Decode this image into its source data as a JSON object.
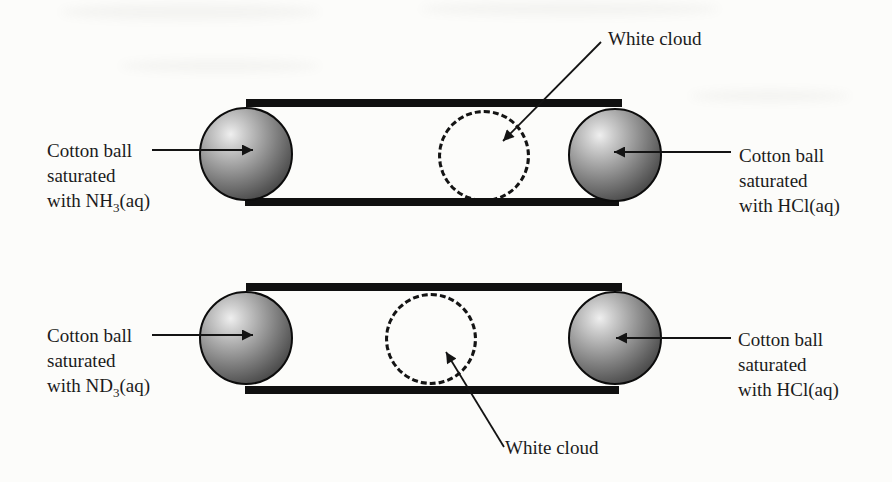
{
  "scene": {
    "background_color": "#fcfcfa",
    "ink_color": "#141414",
    "tube_color": "#101010",
    "sphere_highlight_color": "#efefef",
    "sphere_shadow_color": "#262626"
  },
  "top_tube": {
    "cloud_label": "White cloud",
    "cloud_position": "right of center, nearer HCl end",
    "left_label": {
      "line1": "Cotton ball",
      "line2": "saturated",
      "line3_pre": "with NH",
      "line3_sub": "3",
      "line3_post": "(aq)"
    },
    "right_label": {
      "line1": "Cotton ball",
      "line2": "saturated",
      "line3_pre": "with HCl(aq)",
      "line3_sub": "",
      "line3_post": ""
    }
  },
  "bottom_tube": {
    "cloud_label": "White cloud",
    "cloud_position": "at center of tube",
    "left_label": {
      "line1": "Cotton ball",
      "line2": "saturated",
      "line3_pre": "with ND",
      "line3_sub": "3",
      "line3_post": "(aq)"
    },
    "right_label": {
      "line1": "Cotton ball",
      "line2": "saturated",
      "line3_pre": "with HCl(aq)",
      "line3_sub": "",
      "line3_post": ""
    }
  }
}
